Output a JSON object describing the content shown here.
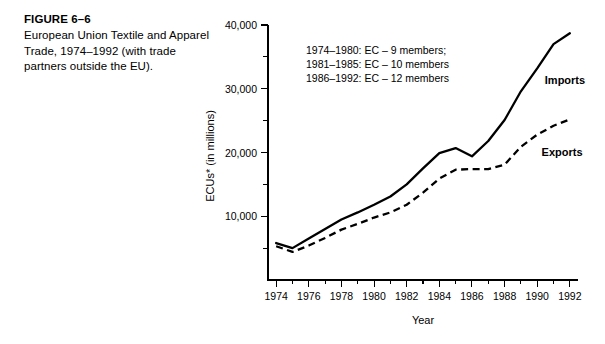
{
  "figure": {
    "number": "FIGURE 6–6",
    "caption": "European Union Textile and Apparel Trade, 1974–1992 (with trade partners outside the EU)."
  },
  "chart_data": {
    "type": "line",
    "title": "",
    "xlabel": "Year",
    "ylabel": "ECUs* (in millions)",
    "x": [
      1974,
      1975,
      1976,
      1977,
      1978,
      1979,
      1980,
      1981,
      1982,
      1983,
      1984,
      1985,
      1986,
      1987,
      1988,
      1989,
      1990,
      1991,
      1992
    ],
    "xlim": [
      1973.5,
      1992.5
    ],
    "ylim": [
      0,
      40000
    ],
    "xticks": [
      1974,
      1976,
      1978,
      1980,
      1982,
      1984,
      1986,
      1988,
      1990,
      1992
    ],
    "xtick_labels": [
      "1974",
      "1976",
      "1978",
      "1980",
      "1982",
      "1984",
      "1986",
      "1988",
      "1990",
      "1992"
    ],
    "yticks": [
      10000,
      20000,
      30000,
      40000
    ],
    "ytick_labels": [
      "10,000",
      "20,000",
      "30,000",
      "40,000"
    ],
    "yminorticks": [
      5000,
      15000,
      25000,
      35000
    ],
    "grid": false,
    "legend_position": "inline-right",
    "series": [
      {
        "name": "Imports",
        "style": "solid",
        "color": "#000000",
        "values": [
          5800,
          5000,
          6500,
          8000,
          9500,
          10600,
          11800,
          13100,
          15000,
          17500,
          19900,
          20700,
          19400,
          21800,
          25100,
          29600,
          33200,
          37000,
          38700
        ]
      },
      {
        "name": "Exports",
        "style": "dashed",
        "color": "#000000",
        "values": [
          5300,
          4400,
          5400,
          6600,
          7900,
          8800,
          9800,
          10600,
          11800,
          13700,
          15900,
          17300,
          17400,
          17400,
          18100,
          20900,
          22800,
          24200,
          25200
        ]
      }
    ],
    "annotations": [
      "1974–1980: EC – 9 members;",
      "1981–1985: EC – 10 members",
      "1986–1992: EC – 12 members"
    ]
  }
}
